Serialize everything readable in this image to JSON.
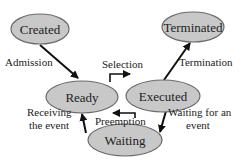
{
  "colors": {
    "node_fill": "#c8c8c8",
    "node_stroke": "#6a6a6a",
    "edge": "#111111",
    "text": "#222222"
  },
  "nodes": {
    "created": {
      "label": "Created"
    },
    "terminated": {
      "label": "Terminated"
    },
    "ready": {
      "label": "Ready"
    },
    "executed": {
      "label": "Executed"
    },
    "waiting": {
      "label": "Waiting"
    }
  },
  "edges": {
    "admission": {
      "label": "Admission",
      "from": "Created",
      "to": "Ready"
    },
    "selection": {
      "label": "Selection",
      "from": "Ready",
      "to": "Executed"
    },
    "preemption": {
      "label": "Preemption",
      "from": "Executed",
      "to": "Ready"
    },
    "termination": {
      "label": "Termination",
      "from": "Executed",
      "to": "Terminated"
    },
    "waiting_for_event": {
      "label_line1": "Waiting for an",
      "label_line2": "event",
      "from": "Executed",
      "to": "Waiting"
    },
    "receiving_event": {
      "label_line1": "Receiving",
      "label_line2": "the event",
      "from": "Waiting",
      "to": "Ready"
    }
  }
}
